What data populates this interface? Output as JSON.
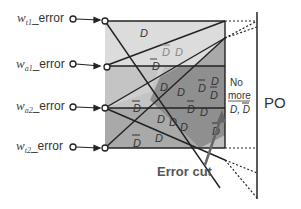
{
  "inputs": [
    {
      "var": "w",
      "sub": "t1",
      "suffix": "_error"
    },
    {
      "var": "w",
      "sub": "a1",
      "suffix": "_error"
    },
    {
      "var": "w",
      "sub": "a2",
      "suffix": "_error"
    },
    {
      "var": "w",
      "sub": "t2",
      "suffix": "_error"
    }
  ],
  "region_labels": {
    "D": "D",
    "Dbar": "D"
  },
  "right_note": {
    "line1": "No",
    "line2": "more",
    "line3": "D, D"
  },
  "output_label": "PO",
  "annotation": "Error cut",
  "colors": {
    "light_gray": "#d9d9d9",
    "mid_gray": "#b3b3b3",
    "dark_gray": "#8c8c8c",
    "line": "#222222",
    "arrow": "#666666"
  }
}
